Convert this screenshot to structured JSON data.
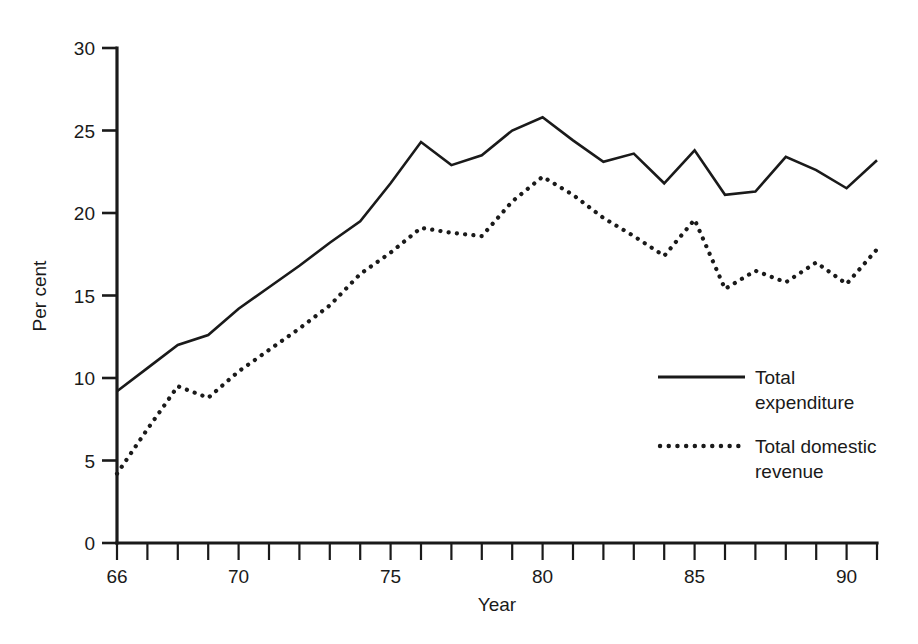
{
  "chart_data": {
    "type": "line",
    "title": "",
    "subtitle": "",
    "xlabel": "Year",
    "ylabel": "Per cent",
    "xlim": [
      66,
      91
    ],
    "ylim": [
      0,
      30
    ],
    "yticks": [
      0,
      5,
      10,
      15,
      20,
      25,
      30
    ],
    "ytick_labels": [
      "0",
      "5",
      "10",
      "15",
      "20",
      "25",
      "30"
    ],
    "xticks": [
      66,
      67,
      68,
      69,
      70,
      71,
      72,
      73,
      74,
      75,
      76,
      77,
      78,
      79,
      80,
      81,
      82,
      83,
      84,
      85,
      86,
      87,
      88,
      89,
      90,
      91
    ],
    "xtick_labels_shown": [
      {
        "x": 66,
        "label": "66"
      },
      {
        "x": 70,
        "label": "70"
      },
      {
        "x": 75,
        "label": "75"
      },
      {
        "x": 80,
        "label": "80"
      },
      {
        "x": 85,
        "label": "85"
      },
      {
        "x": 90,
        "label": "90"
      }
    ],
    "grid": false,
    "legend_position": "inside-lower-right",
    "x": [
      66,
      67,
      68,
      69,
      70,
      71,
      72,
      73,
      74,
      75,
      76,
      77,
      78,
      79,
      80,
      81,
      82,
      83,
      84,
      85,
      86,
      87,
      88,
      89,
      90,
      91
    ],
    "series": [
      {
        "name": "Total expenditure",
        "style": "solid",
        "color": "#1a1a1a",
        "values": [
          9.2,
          10.6,
          12.0,
          12.6,
          14.2,
          15.5,
          16.8,
          18.2,
          19.5,
          21.8,
          24.3,
          22.9,
          23.5,
          25.0,
          25.8,
          24.4,
          23.1,
          23.6,
          21.8,
          23.8,
          21.1,
          21.3,
          23.4,
          22.6,
          21.5,
          23.2
        ]
      },
      {
        "name": "Total domestic revenue",
        "style": "dotted",
        "color": "#1a1a1a",
        "values": [
          4.2,
          6.9,
          9.5,
          8.8,
          10.4,
          11.7,
          13.0,
          14.4,
          16.3,
          17.6,
          19.1,
          18.8,
          18.6,
          20.7,
          22.2,
          21.1,
          19.7,
          18.6,
          17.4,
          19.6,
          15.4,
          16.5,
          15.8,
          17.0,
          15.7,
          17.8
        ]
      }
    ]
  },
  "legend": {
    "entries": [
      {
        "line1": "Total",
        "line2": "expenditure",
        "style": "solid"
      },
      {
        "line1": "Total domestic",
        "line2": "revenue",
        "style": "dotted"
      }
    ]
  },
  "axes": {
    "ylabel": "Per cent",
    "xlabel": "Year"
  }
}
